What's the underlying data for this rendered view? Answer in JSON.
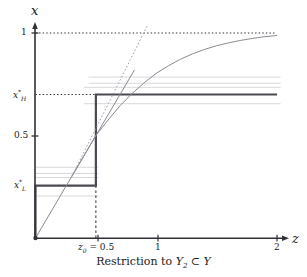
{
  "figure": {
    "caption_prefix": "Restriction to ",
    "caption_y2": "Y",
    "caption_y2_sub": "2",
    "caption_subset": " ⊂ ",
    "caption_y": "Y",
    "caption_full": "Restriction to Y₂ ⊂ Y"
  },
  "axes": {
    "x_axis_label": "z",
    "y_axis_label": "x",
    "x_ticks": [
      {
        "value": 0.5,
        "label": "z₀ = 0.5",
        "label_main": "z",
        "label_sub": "0",
        "label_rest": " = 0.5"
      },
      {
        "value": 1,
        "label": "1"
      },
      {
        "value": 2,
        "label": "2"
      }
    ],
    "y_ticks": [
      {
        "value": 0.5,
        "label": "0.5"
      },
      {
        "value": 1,
        "label": "1"
      }
    ],
    "y_special_ticks": [
      {
        "value": 0.7,
        "label_main": "x",
        "label_sub": "H",
        "label_star": "*"
      },
      {
        "value": 0.255,
        "label_main": "x",
        "label_sub": "L",
        "label_star": "*"
      }
    ],
    "xlim": [
      0,
      2.03
    ],
    "ylim": [
      0,
      1.04
    ]
  },
  "chart_data": {
    "type": "line",
    "title": "",
    "xlabel": "z",
    "ylabel": "x",
    "xlim": [
      0,
      2.03
    ],
    "ylim": [
      0,
      1.04
    ],
    "grid": false,
    "legend": "none",
    "series": [
      {
        "name": "step-policy",
        "style": "thick-solid-dark",
        "color": "#4a4a52",
        "points": [
          [
            0,
            0
          ],
          [
            0,
            0.255
          ],
          [
            0.5,
            0.255
          ],
          [
            0.5,
            0.7
          ],
          [
            2.0,
            0.7
          ]
        ]
      },
      {
        "name": "identity-line",
        "style": "thin-solid-gray",
        "color": "#8a8a92",
        "points": [
          [
            0,
            0
          ],
          [
            0.82,
            0.82
          ]
        ]
      },
      {
        "name": "concave-curve",
        "style": "thin-solid-gray",
        "color": "#8a8a92",
        "points": [
          [
            0.3,
            0.3
          ],
          [
            0.4,
            0.4
          ],
          [
            0.5,
            0.5
          ],
          [
            0.6,
            0.575
          ],
          [
            0.7,
            0.645
          ],
          [
            0.8,
            0.705
          ],
          [
            0.9,
            0.757
          ],
          [
            1.0,
            0.803
          ],
          [
            1.1,
            0.84
          ],
          [
            1.2,
            0.872
          ],
          [
            1.3,
            0.898
          ],
          [
            1.4,
            0.92
          ],
          [
            1.5,
            0.938
          ],
          [
            1.6,
            0.952
          ],
          [
            1.7,
            0.964
          ],
          [
            1.8,
            0.974
          ],
          [
            1.9,
            0.982
          ],
          [
            2.0,
            0.988
          ]
        ]
      },
      {
        "name": "tangent-dotted",
        "style": "dotted-gray",
        "color": "#9a9aa2",
        "points": [
          [
            0.3,
            0.3
          ],
          [
            0.93,
            1.04
          ]
        ]
      }
    ],
    "reference_lines": [
      {
        "name": "y-one-dotted",
        "orientation": "horizontal",
        "value": 1.0,
        "x_from": 0,
        "x_to": 1.98,
        "style": "dotted"
      },
      {
        "name": "xH-dotted",
        "orientation": "horizontal",
        "value": 0.7,
        "x_from": 0,
        "x_to": 0.5,
        "style": "dotted"
      },
      {
        "name": "z0-dashed",
        "orientation": "vertical",
        "value": 0.5,
        "y_from": 0,
        "y_to": 0.7,
        "style": "dashed"
      }
    ],
    "faint_bands": [
      {
        "name": "faint-upper-1",
        "value": 0.785,
        "x_from": 0.44,
        "x_to": 2.03
      },
      {
        "name": "faint-upper-2",
        "value": 0.755,
        "x_from": 0.44,
        "x_to": 2.03
      },
      {
        "name": "faint-upper-3",
        "value": 0.735,
        "x_from": 0.4,
        "x_to": 2.03
      },
      {
        "name": "faint-upper-4",
        "value": 0.655,
        "x_from": 0.4,
        "x_to": 2.03
      },
      {
        "name": "faint-lower-1",
        "value": 0.345,
        "x_from": 0.0,
        "x_to": 0.52
      },
      {
        "name": "faint-lower-2",
        "value": 0.315,
        "x_from": 0.0,
        "x_to": 0.52
      },
      {
        "name": "faint-lower-3",
        "value": 0.295,
        "x_from": 0.0,
        "x_to": 0.52
      },
      {
        "name": "faint-lower-4",
        "value": 0.205,
        "x_from": 0.0,
        "x_to": 0.52
      }
    ],
    "colors": {
      "axis": "#303036",
      "policy": "#4a4a52",
      "curve": "#8a8a92",
      "dotted": "#9a9aa2",
      "faint": "#d8d8dc",
      "background": "#ffffff"
    }
  }
}
